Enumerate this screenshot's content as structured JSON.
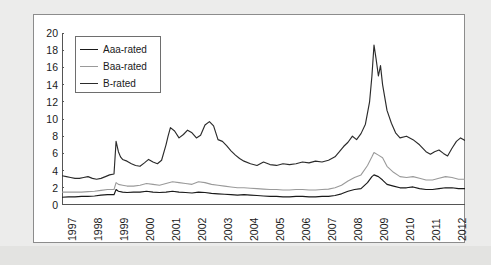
{
  "chart_data": {
    "type": "line",
    "title": "",
    "xlabel": "",
    "ylabel": "Yield spread (%)",
    "ylim": [
      0,
      20
    ],
    "ytick_step": 2,
    "yticks": [
      "20",
      "18",
      "16",
      "14",
      "12",
      "10",
      "8",
      "6",
      "4",
      "2",
      "0"
    ],
    "grid": false,
    "legend_position": "upper-left-inside",
    "xlim": [
      1997,
      2012.5
    ],
    "categories": [
      "1997",
      "1998",
      "1999",
      "2000",
      "2001",
      "2002",
      "2003",
      "2004",
      "2005",
      "2006",
      "2007",
      "2008",
      "2009",
      "2010",
      "2011",
      "2012"
    ],
    "xtick_labels": [
      "1997",
      "1998",
      "1999",
      "2000",
      "2001",
      "2002",
      "2003",
      "2004",
      "2005",
      "2006",
      "2007",
      "2008",
      "2009",
      "2010",
      "2011",
      "2012"
    ],
    "xtick_rotation": -90,
    "colors": {
      "aaa": "#1a1a1a",
      "baa": "#9a9a9a",
      "b": "#2b2b2b",
      "axis": "#555555",
      "panel_background": "#ffffff",
      "page_background": "#ececeb",
      "panel_border": "#8c8c8c"
    },
    "series": [
      {
        "name": "Aaa-rated",
        "color": "#1a1a1a",
        "x": [
          1997.0,
          1997.25,
          1997.5,
          1997.75,
          1998.0,
          1998.25,
          1998.5,
          1998.75,
          1999.0,
          1999.08,
          1999.17,
          1999.33,
          1999.5,
          1999.75,
          2000.0,
          2000.25,
          2000.5,
          2000.75,
          2001.0,
          2001.25,
          2001.5,
          2001.75,
          2002.0,
          2002.25,
          2002.5,
          2002.75,
          2003.0,
          2003.25,
          2003.5,
          2003.75,
          2004.0,
          2004.25,
          2004.5,
          2004.75,
          2005.0,
          2005.25,
          2005.5,
          2005.75,
          2006.0,
          2006.25,
          2006.5,
          2006.75,
          2007.0,
          2007.25,
          2007.5,
          2007.75,
          2008.0,
          2008.25,
          2008.5,
          2008.75,
          2008.92,
          2009.0,
          2009.17,
          2009.33,
          2009.5,
          2009.75,
          2010.0,
          2010.25,
          2010.5,
          2010.75,
          2011.0,
          2011.25,
          2011.5,
          2011.75,
          2012.0,
          2012.25,
          2012.5
        ],
        "y": [
          0.9,
          0.95,
          0.95,
          1.0,
          1.0,
          1.05,
          1.15,
          1.2,
          1.2,
          1.8,
          1.6,
          1.5,
          1.45,
          1.5,
          1.5,
          1.6,
          1.5,
          1.45,
          1.5,
          1.6,
          1.5,
          1.45,
          1.4,
          1.5,
          1.45,
          1.35,
          1.3,
          1.25,
          1.2,
          1.15,
          1.2,
          1.15,
          1.1,
          1.05,
          1.0,
          1.0,
          0.95,
          0.95,
          1.0,
          1.0,
          0.95,
          0.95,
          1.0,
          1.0,
          1.1,
          1.3,
          1.6,
          1.8,
          1.9,
          2.6,
          3.3,
          3.5,
          3.3,
          2.9,
          2.4,
          2.2,
          2.0,
          2.0,
          2.1,
          1.9,
          1.8,
          1.8,
          1.9,
          2.0,
          2.0,
          1.9,
          1.9
        ]
      },
      {
        "name": "Baa-rated",
        "color": "#9a9a9a",
        "x": [
          1997.0,
          1997.25,
          1997.5,
          1997.75,
          1998.0,
          1998.25,
          1998.5,
          1998.75,
          1999.0,
          1999.08,
          1999.17,
          1999.33,
          1999.5,
          1999.75,
          2000.0,
          2000.25,
          2000.5,
          2000.75,
          2001.0,
          2001.25,
          2001.5,
          2001.75,
          2002.0,
          2002.25,
          2002.5,
          2002.75,
          2003.0,
          2003.25,
          2003.5,
          2003.75,
          2004.0,
          2004.25,
          2004.5,
          2004.75,
          2005.0,
          2005.25,
          2005.5,
          2005.75,
          2006.0,
          2006.25,
          2006.5,
          2006.75,
          2007.0,
          2007.25,
          2007.5,
          2007.75,
          2008.0,
          2008.25,
          2008.5,
          2008.75,
          2008.92,
          2009.0,
          2009.17,
          2009.33,
          2009.5,
          2009.75,
          2010.0,
          2010.25,
          2010.5,
          2010.75,
          2011.0,
          2011.25,
          2011.5,
          2011.75,
          2012.0,
          2012.25,
          2012.5
        ],
        "y": [
          1.5,
          1.5,
          1.5,
          1.5,
          1.55,
          1.6,
          1.7,
          1.8,
          1.8,
          2.6,
          2.4,
          2.3,
          2.2,
          2.2,
          2.3,
          2.5,
          2.4,
          2.3,
          2.5,
          2.7,
          2.6,
          2.5,
          2.4,
          2.7,
          2.6,
          2.4,
          2.3,
          2.2,
          2.1,
          2.0,
          2.0,
          1.95,
          1.9,
          1.85,
          1.8,
          1.8,
          1.75,
          1.75,
          1.8,
          1.8,
          1.75,
          1.75,
          1.8,
          1.85,
          2.0,
          2.3,
          2.8,
          3.2,
          3.5,
          4.6,
          5.6,
          6.1,
          5.8,
          5.5,
          4.5,
          3.8,
          3.3,
          3.2,
          3.3,
          3.1,
          2.9,
          2.9,
          3.1,
          3.3,
          3.2,
          3.0,
          3.0
        ]
      },
      {
        "name": "B-rated",
        "color": "#2b2b2b",
        "x": [
          1997.0,
          1997.17,
          1997.33,
          1997.5,
          1997.67,
          1997.83,
          1998.0,
          1998.17,
          1998.33,
          1998.5,
          1998.67,
          1998.83,
          1999.0,
          1999.08,
          1999.17,
          1999.25,
          1999.33,
          1999.5,
          1999.67,
          1999.83,
          2000.0,
          2000.17,
          2000.33,
          2000.5,
          2000.67,
          2000.83,
          2001.0,
          2001.08,
          2001.17,
          2001.33,
          2001.5,
          2001.67,
          2001.83,
          2002.0,
          2002.17,
          2002.33,
          2002.5,
          2002.67,
          2002.83,
          2003.0,
          2003.17,
          2003.33,
          2003.5,
          2003.67,
          2003.83,
          2004.0,
          2004.25,
          2004.5,
          2004.75,
          2005.0,
          2005.25,
          2005.5,
          2005.75,
          2006.0,
          2006.25,
          2006.5,
          2006.75,
          2007.0,
          2007.25,
          2007.5,
          2007.67,
          2007.83,
          2008.0,
          2008.17,
          2008.33,
          2008.5,
          2008.67,
          2008.83,
          2008.92,
          2009.0,
          2009.08,
          2009.17,
          2009.25,
          2009.33,
          2009.5,
          2009.67,
          2009.83,
          2010.0,
          2010.25,
          2010.5,
          2010.75,
          2011.0,
          2011.17,
          2011.33,
          2011.5,
          2011.67,
          2011.83,
          2012.0,
          2012.17,
          2012.33,
          2012.5
        ],
        "y": [
          3.4,
          3.3,
          3.2,
          3.1,
          3.1,
          3.2,
          3.3,
          3.1,
          3.0,
          3.1,
          3.3,
          3.5,
          3.6,
          7.4,
          6.2,
          5.6,
          5.3,
          5.1,
          4.8,
          4.6,
          4.5,
          4.9,
          5.3,
          5.0,
          4.8,
          5.2,
          7.0,
          8.0,
          9.0,
          8.6,
          7.8,
          8.2,
          8.7,
          8.4,
          7.8,
          8.1,
          9.3,
          9.7,
          9.2,
          7.6,
          7.4,
          6.9,
          6.3,
          5.8,
          5.4,
          5.1,
          4.8,
          4.6,
          5.0,
          4.7,
          4.6,
          4.8,
          4.7,
          4.8,
          5.0,
          4.9,
          5.1,
          5.0,
          5.2,
          5.6,
          6.2,
          6.8,
          7.3,
          8.0,
          7.6,
          8.3,
          9.4,
          12.0,
          15.0,
          18.6,
          17.0,
          15.0,
          16.2,
          14.0,
          11.0,
          9.5,
          8.4,
          7.8,
          8.0,
          7.6,
          7.0,
          6.2,
          5.9,
          6.2,
          6.4,
          6.0,
          5.7,
          6.6,
          7.4,
          7.8,
          7.5
        ]
      }
    ]
  },
  "legend": {
    "items": [
      {
        "label": "Aaa-rated",
        "color": "#1a1a1a"
      },
      {
        "label": "Baa-rated",
        "color": "#9a9a9a"
      },
      {
        "label": "B-rated",
        "color": "#2b2b2b"
      }
    ]
  }
}
